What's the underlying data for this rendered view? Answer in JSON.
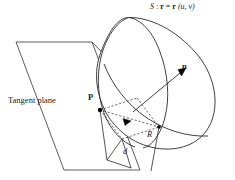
{
  "figure": {
    "title_label": "S : r = r (u, v)",
    "surface_symbol": "S",
    "colon": " : ",
    "equals": " = ",
    "vector_r": "r",
    "params": " (u, v)",
    "tangent_plane_label": "Tangent plane",
    "normal_label": "n",
    "point_p_label": "P",
    "point_r_label": "R",
    "distance_label": "d",
    "stroke_color": "#2b2b2b",
    "background_color": "#ffffff",
    "dot_color": "#000000"
  },
  "geometry": {
    "tangent_plane_points": "16,42 92,42 140,170 64,170",
    "surface_outer_path": "M 128.5,17.5 C 150,17 176,30 196,53 C 214,74 219,100 212,120 C 205,140 186,150 164,149 C 141,148 120,135 108,116 C 96,96 93,72 101,52 C 108,33 117,18 128.5,17.5 Z",
    "surface_rim_path": "M 128.5,17.5 C 141,19 153,32 160,52 C 168,73 170,98 165,117 C 161,134 152,146 143,148",
    "surface_left_lip_path": "M 128.5,17.5 C 116,22 106,38 101,57 C 96,78 98,102 107,120 C 114,134 124,143 135,147",
    "surface_inner_curve_path": "M 104,64 C 112,84 126,104 147,118 C 165,130 187,137 208,136",
    "normal_line": "133,112 186,68",
    "normal_arrow": "186,68 178,69.5 181.5,76",
    "plane_edge_right": "92,42 122,73",
    "dash_p_to_mid": "100,110 137,98",
    "dash_mid_to_r": "137,98 159,127",
    "dash_p_to_low": "100,110 122,139",
    "dash_low_to_r": "122,139 159,127",
    "diag_arrow_tip": "131,121",
    "diag_arrow": "131,121 123,118.5 125,125.5",
    "solid_p_to_r": "100,110 159,127",
    "vert_p_drop": "100,110 107,160",
    "vert_r_drop": "159,127 151,171",
    "d_line": "122,139 131,168",
    "small_tri_left": "107,160 122,139",
    "small_tri_right": "107,160 131,168",
    "point_p": {
      "cx": 100,
      "cy": 110,
      "r": 2.2
    },
    "point_r": {
      "cx": 159,
      "cy": 127,
      "r": 1.8
    }
  }
}
